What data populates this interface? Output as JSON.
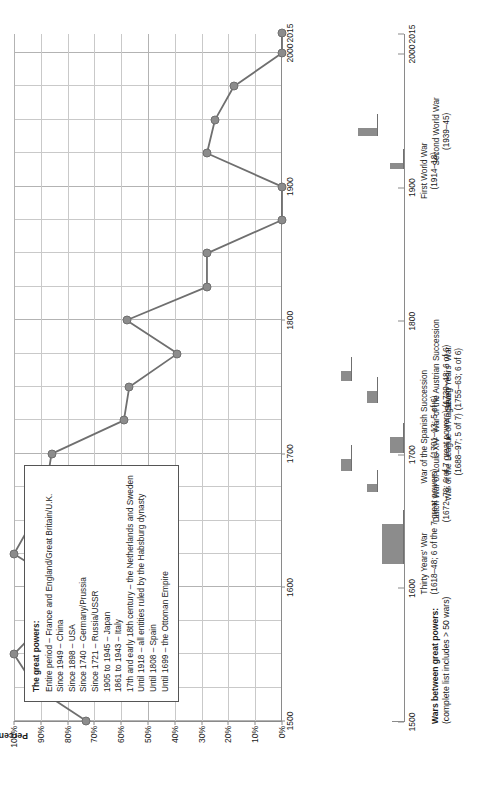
{
  "chart_data": {
    "type": "line",
    "title": "",
    "xlabel": "",
    "ylabel": "Percentage of years in which the great powers fought one another",
    "xlim": [
      1500,
      2015
    ],
    "ylim": [
      0,
      100
    ],
    "grid": true,
    "x_ticks": [
      1500,
      1600,
      1700,
      1800,
      1900,
      2000,
      2015
    ],
    "x_tick_labels": [
      "1500",
      "1600",
      "1700",
      "1800",
      "1900",
      "2000",
      "2015"
    ],
    "y_ticks": [
      0,
      10,
      20,
      30,
      40,
      50,
      60,
      70,
      80,
      90,
      100
    ],
    "y_tick_labels": [
      "0%",
      "10%",
      "20%",
      "30%",
      "40%",
      "50%",
      "60%",
      "70%",
      "80%",
      "90%",
      "100%"
    ],
    "series": [
      {
        "name": "Percentage of years great powers fought one another",
        "color": "#8c8c8c",
        "points": [
          {
            "x": 1500,
            "y": 73
          },
          {
            "x": 1525,
            "y": 92
          },
          {
            "x": 1550,
            "y": 100
          },
          {
            "x": 1575,
            "y": 88
          },
          {
            "x": 1600,
            "y": 80
          },
          {
            "x": 1625,
            "y": 100
          },
          {
            "x": 1650,
            "y": 93
          },
          {
            "x": 1675,
            "y": 88
          },
          {
            "x": 1700,
            "y": 86
          },
          {
            "x": 1725,
            "y": 59
          },
          {
            "x": 1750,
            "y": 57
          },
          {
            "x": 1775,
            "y": 39
          },
          {
            "x": 1800,
            "y": 58
          },
          {
            "x": 1825,
            "y": 28
          },
          {
            "x": 1850,
            "y": 28
          },
          {
            "x": 1875,
            "y": 0
          },
          {
            "x": 1900,
            "y": 0
          },
          {
            "x": 1925,
            "y": 28
          },
          {
            "x": 1950,
            "y": 25
          },
          {
            "x": 1975,
            "y": 18
          },
          {
            "x": 2000,
            "y": 0
          },
          {
            "x": 2015,
            "y": 0
          }
        ]
      }
    ]
  },
  "legend": {
    "title": "The great powers:",
    "items": [
      "Entire period – France and England/Great Britain/U.K.",
      "Since 1949 – China",
      "Since 1898 – USA",
      "Since 1740 – Germany/Prussia",
      "Since 1721 – Russia/USSR",
      "1905 to 1945 – Japan",
      "1861 to 1943 – Italy",
      "17th and early 18th century – the Netherlands and Sweden",
      "Until 1918 – all entities ruled by the Habsburg dynasty",
      "Until 1808 – Spain",
      "Until 1699 – the Ottoman Empire"
    ]
  },
  "wars_panel": {
    "title": "Wars between great powers:",
    "subtitle": "(complete list includes > 50 wars)",
    "x_ticks": [
      1500,
      1600,
      1700,
      1800,
      1900,
      2000,
      2015
    ],
    "x_tick_labels": [
      "1500",
      "1600",
      "1700",
      "1800",
      "1900",
      "2000",
      "2015"
    ],
    "bars": [
      {
        "name": "Thirty Years' War",
        "start": 1618,
        "end": 1648,
        "height": 22,
        "row": 0,
        "label_line1": "Thirty Years' War",
        "label_line2": "(1618–48; 6 of the 7 great powers)"
      },
      {
        "name": "Dutch War of Louis XIV",
        "start": 1672,
        "end": 1678,
        "height": 11,
        "row": 1,
        "label_line1": "Dutch War of Louis XIV",
        "label_line2": "(1672–78; 6 of 7 great powers)"
      },
      {
        "name": "War of the League of Augsburg",
        "start": 1688,
        "end": 1697,
        "height": 11,
        "row": 2,
        "label_line1": "War of the League of Augsburg",
        "label_line2": "(1688–97; 5 of 7)"
      },
      {
        "name": "War of the Spanish Succession",
        "start": 1701,
        "end": 1713,
        "height": 14,
        "row": 0,
        "label_line1": "War of the Spanish Succession",
        "label_line2": "(1701–13; 5 of 6)"
      },
      {
        "name": "War of the Austrian Succession",
        "start": 1739,
        "end": 1748,
        "height": 11,
        "row": 1,
        "label_line1": "War of the Austrian Succession",
        "label_line2": "(1739–48; 6 of 6)"
      },
      {
        "name": "Seven Years' War",
        "start": 1755,
        "end": 1763,
        "height": 11,
        "row": 2,
        "label_line1": "Seven Years' War",
        "label_line2": "(1755–63; 6 of 6)"
      },
      {
        "name": "First World War",
        "start": 1914,
        "end": 1918,
        "height": 14,
        "row": 0,
        "label_line1": "First World War",
        "label_line2": "(1914–18)"
      },
      {
        "name": "Second World War",
        "start": 1939,
        "end": 1945,
        "height": 20,
        "row": 1,
        "label_line1": "Second World War",
        "label_line2": "(1939–45)"
      }
    ]
  },
  "colors": {
    "series": "#8c8c8c",
    "bar": "#8c8c8c",
    "axis": "#8a8a8a",
    "grid": "#c9c9c9"
  }
}
